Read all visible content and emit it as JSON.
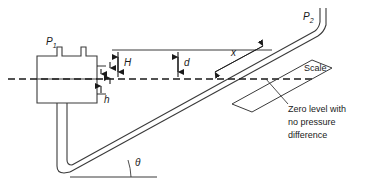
{
  "figure": {
    "type": "engineering-diagram",
    "background_color": "#ffffff",
    "line_color": "#1a1a1a",
    "text_color": "#1a1a1a"
  },
  "labels": {
    "p1": "P",
    "p1_sub": "1",
    "p2": "P",
    "p2_sub": "2",
    "height_H": "H",
    "height_d": "d",
    "height_h": "h",
    "length_x": "x",
    "angle_theta": "θ",
    "scale": "Scale",
    "zero_level_line1": "Zero level with",
    "zero_level_line2": "no pressure",
    "zero_level_line3": "difference"
  },
  "annotations": {
    "zero_level_note": "Zero level with no pressure difference",
    "dashed_line_meaning": "zero level datum",
    "dimension_names": [
      "H",
      "d",
      "h",
      "x",
      "θ"
    ]
  }
}
